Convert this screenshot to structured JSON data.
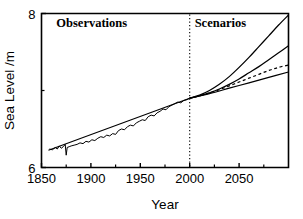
{
  "chart_data": {
    "type": "line",
    "title": "",
    "xlabel": "Year",
    "ylabel": "Sea Level /m",
    "xlim": [
      1850,
      2100
    ],
    "ylim": [
      6,
      8
    ],
    "grid": false,
    "legend_position": "none",
    "x_ticks_major": [
      1850,
      1900,
      1950,
      2000,
      2050
    ],
    "x_tick_labels": [
      "1850",
      "1900",
      "1950",
      "2000",
      "2050"
    ],
    "x_ticks_minor": [
      1875,
      1925,
      1975,
      2025,
      2075
    ],
    "y_ticks_major": [
      6,
      8
    ],
    "y_tick_labels": [
      "6",
      "8"
    ],
    "y_ticks_minor": [
      7
    ],
    "annotations": [
      {
        "text": "Observations",
        "x": 1865,
        "y": 7.82
      },
      {
        "text": "Scenarios",
        "x": 2005,
        "y": 7.82
      }
    ],
    "divider": {
      "x": 2000,
      "style": "dotted",
      "label": "present-day boundary"
    },
    "series": [
      {
        "name": "Observed sea level (annual, noisy)",
        "style": "solid",
        "x": [
          1858,
          1861,
          1864,
          1866,
          1868,
          1870,
          1872,
          1874,
          1875,
          1876,
          1878,
          1880,
          1883,
          1886,
          1889,
          1892,
          1895,
          1898,
          1901,
          1904,
          1907,
          1910,
          1913,
          1916,
          1919,
          1922,
          1925,
          1928,
          1931,
          1934,
          1937,
          1940,
          1943,
          1946,
          1949,
          1952,
          1955,
          1958,
          1961,
          1964,
          1967,
          1970,
          1973,
          1976,
          1979,
          1982,
          1985,
          1988,
          1991,
          1994,
          1997,
          2000
        ],
        "y": [
          6.24,
          6.23,
          6.26,
          6.24,
          6.28,
          6.25,
          6.27,
          6.3,
          6.16,
          6.26,
          6.27,
          6.28,
          6.29,
          6.3,
          6.32,
          6.31,
          6.34,
          6.33,
          6.36,
          6.35,
          6.38,
          6.4,
          6.39,
          6.42,
          6.41,
          6.44,
          6.43,
          6.48,
          6.5,
          6.49,
          6.53,
          6.55,
          6.54,
          6.58,
          6.6,
          6.62,
          6.61,
          6.66,
          6.68,
          6.67,
          6.71,
          6.73,
          6.76,
          6.75,
          6.79,
          6.81,
          6.83,
          6.85,
          6.84,
          6.87,
          6.88,
          6.9
        ]
      },
      {
        "name": "Observed trend line",
        "style": "solid",
        "x": [
          1857,
          2000
        ],
        "y": [
          6.225,
          6.9
        ]
      },
      {
        "name": "Scenario high",
        "style": "solid",
        "x": [
          2000,
          2010,
          2020,
          2030,
          2040,
          2050,
          2060,
          2070,
          2080,
          2090,
          2100
        ],
        "y": [
          6.9,
          6.94,
          7.0,
          7.08,
          7.18,
          7.3,
          7.43,
          7.57,
          7.71,
          7.85,
          7.98
        ]
      },
      {
        "name": "Scenario mid",
        "style": "solid",
        "x": [
          2000,
          2010,
          2020,
          2030,
          2040,
          2050,
          2060,
          2070,
          2080,
          2090,
          2100
        ],
        "y": [
          6.9,
          6.93,
          6.97,
          7.02,
          7.08,
          7.15,
          7.23,
          7.31,
          7.4,
          7.49,
          7.58
        ]
      },
      {
        "name": "Scenario central (dashed)",
        "style": "dashed",
        "x": [
          2000,
          2010,
          2020,
          2030,
          2040,
          2050,
          2060,
          2070,
          2080,
          2090,
          2100
        ],
        "y": [
          6.9,
          6.93,
          6.97,
          7.01,
          7.06,
          7.11,
          7.16,
          7.21,
          7.26,
          7.3,
          7.33
        ]
      },
      {
        "name": "Scenario low",
        "style": "solid",
        "x": [
          2000,
          2020,
          2040,
          2060,
          2080,
          2100
        ],
        "y": [
          6.9,
          6.96,
          7.03,
          7.1,
          7.17,
          7.24
        ]
      }
    ]
  }
}
